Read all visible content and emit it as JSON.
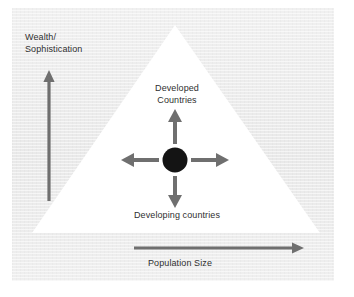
{
  "figure": {
    "axes": {
      "vertical": {
        "label_line1": "Wealth/",
        "label_line2": "Sophistication",
        "direction": "up",
        "arrow_color": "#6f6f6f"
      },
      "horizontal": {
        "label": "Population Size",
        "direction": "right",
        "arrow_color": "#6f6f6f"
      }
    },
    "triangle": {
      "fill": "#ffffff",
      "apex": "top",
      "description": "white triangle representing the population pyramid"
    },
    "center_marker": {
      "shape": "filled-circle",
      "color": "#141414"
    },
    "segments": {
      "top_line1": "Developed",
      "top_line2": "Countries",
      "bottom": "Developing countries"
    },
    "radial_arrows": [
      {
        "name": "arrow-up",
        "direction": "up",
        "color": "#6f6f6f"
      },
      {
        "name": "arrow-down",
        "direction": "down",
        "color": "#6f6f6f"
      },
      {
        "name": "arrow-left",
        "direction": "left",
        "color": "#6f6f6f"
      },
      {
        "name": "arrow-right",
        "direction": "right",
        "color": "#6f6f6f"
      }
    ],
    "colors": {
      "panel_background": "#ededed",
      "page_background": "#ffffff",
      "triangle_fill": "#ffffff",
      "arrow_gray": "#6f6f6f",
      "text": "#2f2f2f",
      "circle_black": "#141414"
    }
  }
}
